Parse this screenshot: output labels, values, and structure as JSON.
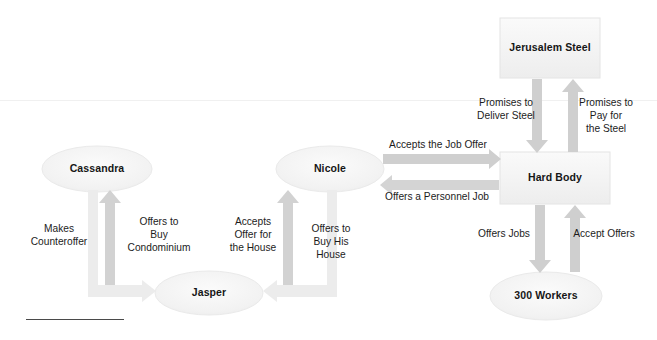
{
  "diagram": {
    "colors": {
      "node_fill": "#f4f4f4",
      "node_stroke": "#e2e2e2",
      "arrow": "#c9c9c9",
      "text": "#161616",
      "rule": "#4a4a4a",
      "background": "#ffffff"
    },
    "nodes": [
      {
        "id": "jerusalem-steel",
        "label": "Jerusalem\nSteel",
        "shape": "rect",
        "x": 500,
        "y": 18,
        "w": 100,
        "h": 60
      },
      {
        "id": "cassandra",
        "label": "Cassandra",
        "shape": "ellipse",
        "x": 42,
        "y": 146,
        "w": 110,
        "h": 46
      },
      {
        "id": "nicole",
        "label": "Nicole",
        "shape": "ellipse",
        "x": 276,
        "y": 146,
        "w": 108,
        "h": 46
      },
      {
        "id": "hard-body",
        "label": "Hard Body",
        "shape": "rect",
        "x": 500,
        "y": 152,
        "w": 110,
        "h": 52
      },
      {
        "id": "jasper",
        "label": "Jasper",
        "shape": "ellipse",
        "x": 155,
        "y": 271,
        "w": 108,
        "h": 44
      },
      {
        "id": "300-workers",
        "label": "300 Workers",
        "shape": "ellipse",
        "x": 490,
        "y": 272,
        "w": 112,
        "h": 48
      }
    ],
    "edges": [
      {
        "id": "promises-to-deliver-steel",
        "label": "Promises to\nDeliver Steel",
        "from": "jerusalem-steel",
        "to": "hard-body",
        "direction": "down",
        "label_x": 466,
        "label_y": 96,
        "label_w": 80
      },
      {
        "id": "promises-to-pay-for-the-steel",
        "label": "Promises to\nPay for\nthe Steel",
        "from": "hard-body",
        "to": "jerusalem-steel",
        "direction": "up",
        "label_x": 566,
        "label_y": 96,
        "label_w": 80
      },
      {
        "id": "accepts-the-job-offer",
        "label": "Accepts the Job Offer",
        "from": "nicole",
        "to": "hard-body",
        "direction": "right",
        "label_x": 378,
        "label_y": 138,
        "label_w": 120
      },
      {
        "id": "offers-a-personnel-job",
        "label": "Offers a Personnel Job",
        "from": "hard-body",
        "to": "nicole",
        "direction": "left",
        "label_x": 372,
        "label_y": 190,
        "label_w": 130
      },
      {
        "id": "offers-jobs",
        "label": "Offers Jobs",
        "from": "hard-body",
        "to": "300-workers",
        "direction": "down",
        "label_x": 471,
        "label_y": 227,
        "label_w": 66
      },
      {
        "id": "accept-offers",
        "label": "Accept Offers",
        "from": "300-workers",
        "to": "hard-body",
        "direction": "up",
        "label_x": 566,
        "label_y": 227,
        "label_w": 76
      },
      {
        "id": "makes-counteroffer",
        "label": "Makes\nCounteroffer",
        "from": "cassandra",
        "to": "jasper",
        "direction": "elbow-down-right",
        "label_x": 23,
        "label_y": 222,
        "label_w": 72
      },
      {
        "id": "offers-to-buy-condominium",
        "label": "Offers to\nBuy\nCondominium",
        "from": "jasper",
        "to": "cassandra",
        "direction": "up",
        "label_x": 118,
        "label_y": 215,
        "label_w": 82
      },
      {
        "id": "accepts-offer-for-the-house",
        "label": "Accepts\nOffer for\nthe House",
        "from": "jasper",
        "to": "nicole",
        "direction": "up",
        "label_x": 222,
        "label_y": 215,
        "label_w": 62
      },
      {
        "id": "offers-to-buy-his-house",
        "label": "Offers to\nBuy His\nHouse",
        "from": "nicole",
        "to": "jasper",
        "direction": "elbow-down-left",
        "label_x": 300,
        "label_y": 222,
        "label_w": 62
      }
    ]
  }
}
